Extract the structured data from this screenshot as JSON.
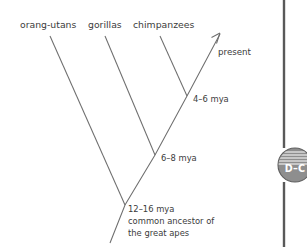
{
  "figure": {
    "type": "phylogenetic-tree-diagram",
    "title": "",
    "tips": [
      {
        "id": "orang-utans",
        "label": "orang-utans",
        "label_x": 20,
        "label_y": 28,
        "tip_x": 50,
        "tip_y": 36
      },
      {
        "id": "gorillas",
        "label": "gorillas",
        "label_x": 88,
        "label_y": 28,
        "tip_x": 105,
        "tip_y": 36
      },
      {
        "id": "chimpanzees",
        "label": "chimpanzees",
        "label_x": 133,
        "label_y": 28,
        "tip_x": 160,
        "tip_y": 36
      }
    ],
    "nodes": [
      {
        "id": "node-4-6",
        "label": "4–6 mya",
        "label_x": 193,
        "label_y": 102,
        "node_x": 187,
        "node_y": 96
      },
      {
        "id": "node-6-8",
        "label": "6–8 mya",
        "label_x": 161,
        "label_y": 161,
        "node_x": 155,
        "node_y": 155
      },
      {
        "id": "node-12-16",
        "label": "12–16 mya",
        "label_x": 128,
        "label_y": 212,
        "node_x": 125,
        "node_y": 205
      }
    ],
    "root_caption": {
      "lines": [
        "12–16 mya",
        "common ancestor of",
        "the great apes"
      ]
    },
    "present": {
      "label": "present",
      "label_x": 218,
      "label_y": 55,
      "arrow_tip_x": 222,
      "arrow_tip_y": 32
    },
    "colors": {
      "branch": "#6e6e6e",
      "text": "#3b3b3b",
      "rule": "#595959",
      "badge_fill": "#8e8e8e",
      "badge_stroke": "#5f5f5f",
      "badge_text": "#ffffff",
      "background": "#ffffff"
    }
  },
  "margin_marker": {
    "code": "D–C",
    "shape": "striped-circle",
    "center_x": 295,
    "center_y": 165,
    "radius": 17
  }
}
